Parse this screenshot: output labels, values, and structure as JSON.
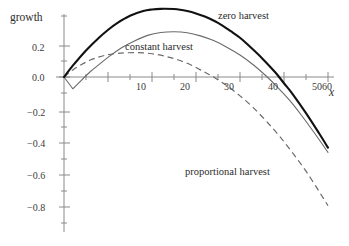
{
  "chart_data": {
    "type": "line",
    "title": "",
    "xlabel": "x",
    "ylabel": "growth",
    "xlim": [
      -2,
      62
    ],
    "ylim": [
      -0.95,
      0.42
    ],
    "grid": false,
    "legend_position": "inline-annotations",
    "x_ticks_major": [
      10,
      20,
      30,
      40,
      50,
      60
    ],
    "x_ticks_minor": [
      5,
      15,
      25,
      35,
      45,
      55
    ],
    "y_ticks_major": [
      0.2,
      0.0,
      -0.2,
      -0.4,
      -0.6,
      -0.8
    ],
    "y_ticks_minor": [
      0.1,
      -0.1,
      -0.3,
      -0.5,
      -0.7,
      -0.9
    ],
    "x_tick_labels": [
      "10",
      "20",
      "30",
      "40",
      "50",
      "60"
    ],
    "y_tick_labels": [
      "0.2",
      "0.0",
      "−0.2",
      "−0.4",
      "−0.6",
      "−0.8"
    ],
    "series": [
      {
        "name": "zero harvest",
        "style": "solid-thick",
        "color": "#111111",
        "peak_x": 26,
        "peak_y": 0.375,
        "zero_crossing_x": 50,
        "x": [
          0,
          2,
          5,
          8,
          10,
          12,
          15,
          18,
          20,
          22,
          25,
          26,
          28,
          30,
          32,
          35,
          38,
          40,
          42,
          45,
          48,
          50,
          52,
          55,
          58,
          60
        ],
        "y": [
          0.0,
          0.072,
          0.169,
          0.252,
          0.3,
          0.342,
          0.39,
          0.42,
          0.43,
          0.434,
          0.433,
          0.43,
          0.42,
          0.405,
          0.385,
          0.345,
          0.29,
          0.25,
          0.2,
          0.12,
          0.03,
          -0.04,
          -0.11,
          -0.23,
          -0.36,
          -0.45
        ]
      },
      {
        "name": "constant harvest",
        "style": "solid-thin",
        "color": "#6a6a6a",
        "peak_x": 25,
        "peak_y": 0.275,
        "zero_crossing_x": 47,
        "notch_x": 2,
        "notch_y": -0.075,
        "x": [
          0,
          2,
          4,
          6,
          8,
          10,
          13,
          16,
          19,
          22,
          25,
          28,
          31,
          34,
          37,
          40,
          43,
          46,
          48,
          51,
          54,
          57,
          60
        ],
        "y": [
          0.0,
          -0.075,
          -0.02,
          0.035,
          0.08,
          0.125,
          0.185,
          0.23,
          0.265,
          0.283,
          0.288,
          0.282,
          0.262,
          0.232,
          0.19,
          0.14,
          0.078,
          0.005,
          -0.05,
          -0.14,
          -0.245,
          -0.36,
          -0.48
        ]
      },
      {
        "name": "proportional harvest",
        "style": "dashed",
        "color": "#6a6a6a",
        "peak_x": 17,
        "peak_y": 0.155,
        "zero_crossing_x": 34,
        "x": [
          0,
          2,
          4,
          6,
          8,
          10,
          12,
          14,
          17,
          20,
          23,
          26,
          29,
          32,
          34,
          37,
          40,
          43,
          46,
          49,
          52,
          55,
          58,
          60
        ],
        "y": [
          0.0,
          0.045,
          0.08,
          0.108,
          0.128,
          0.142,
          0.15,
          0.154,
          0.155,
          0.148,
          0.132,
          0.108,
          0.075,
          0.03,
          0.0,
          -0.055,
          -0.12,
          -0.195,
          -0.282,
          -0.378,
          -0.485,
          -0.6,
          -0.73,
          -0.82
        ]
      }
    ],
    "annotations": [
      {
        "text": "zero harvest",
        "x": 36,
        "y": 0.4
      },
      {
        "text": "constant harvest",
        "x": 14,
        "y": 0.205
      },
      {
        "text": "proportional harvest",
        "x": 28,
        "y": -0.585
      }
    ]
  },
  "labels": {
    "y_axis": "growth",
    "x_axis": "x",
    "zero_harvest": "zero harvest",
    "constant_harvest": "constant harvest",
    "proportional_harvest": "proportional harvest"
  },
  "ticks": {
    "y": {
      "p02": "0.2",
      "p00": "0.0",
      "m02": "−0.2",
      "m04": "−0.4",
      "m06": "−0.6",
      "m08": "−0.8"
    },
    "x": {
      "t10": "10",
      "t20": "20",
      "t30": "30",
      "t40": "40",
      "t50": "50",
      "t60": "60"
    }
  },
  "colors": {
    "zero_harvest": "#111111",
    "constant_harvest": "#6a6a6a",
    "proportional_harvest": "#6a6a6a",
    "axis": "#8a8a8a",
    "text": "#2b2b2b",
    "background": "#ffffff"
  }
}
